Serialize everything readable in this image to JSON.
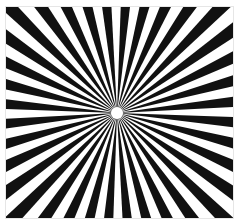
{
  "image": {
    "subject": "radial starburst pattern",
    "description": "Black and white alternating rays radiating from a central point within a square frame",
    "colors": {
      "ray": "#111111",
      "background": "#ffffff",
      "frame": "#e6e6e6"
    },
    "center": [
      117,
      113
    ],
    "bounds": {
      "x": 6,
      "y": 7,
      "width": 227,
      "height": 211
    },
    "ray_count": 36,
    "center_hole_radius": 6
  }
}
